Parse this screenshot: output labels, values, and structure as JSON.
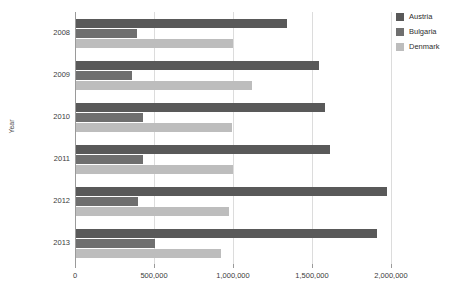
{
  "chart_data": {
    "type": "bar",
    "orientation": "horizontal",
    "title": "",
    "xlabel": "",
    "ylabel": "Year",
    "categories": [
      "2008",
      "2009",
      "2010",
      "2011",
      "2012",
      "2013"
    ],
    "series": [
      {
        "name": "Austria",
        "color": "#595959",
        "values": [
          1336000,
          1536000,
          1574000,
          1605000,
          1968000,
          1905000
        ]
      },
      {
        "name": "Bulgaria",
        "color": "#6f6f6f",
        "values": [
          383000,
          352000,
          427000,
          421000,
          390000,
          500000
        ]
      },
      {
        "name": "Denmark",
        "color": "#bdbdbd",
        "values": [
          991000,
          1115000,
          985000,
          993000,
          968000,
          920000
        ]
      }
    ],
    "xlim": [
      0,
      2000000
    ],
    "xticks": [
      0,
      500000,
      1000000,
      1500000,
      2000000
    ],
    "xtick_labels": [
      "0",
      "500,000",
      "1,000,000",
      "1,500,000",
      "2,000,000"
    ],
    "grid": "vertical",
    "legend_position": "right"
  },
  "legend": {
    "items": [
      {
        "label": "Austria"
      },
      {
        "label": "Bulgaria"
      },
      {
        "label": "Denmark"
      }
    ]
  },
  "axes": {
    "y_axis_title": "Year"
  }
}
